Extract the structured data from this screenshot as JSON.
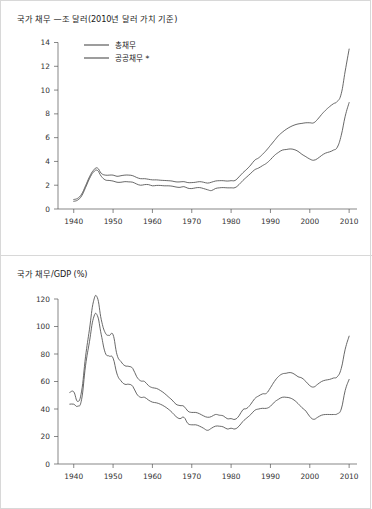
{
  "figure": {
    "background_color": "#ffffff",
    "border_color": "#d8d8d8",
    "line_color": "#4d4d4d",
    "axis_color": "#555555"
  },
  "panels": [
    {
      "id": "debt",
      "title": "국가 채무 —조 달러(2010년 달러 가치 기준)",
      "legend": {
        "position": "top-left",
        "entries": [
          {
            "label": "총채무"
          },
          {
            "label": "공공채무 *"
          }
        ]
      }
    },
    {
      "id": "ratio",
      "title": "국가 채무/GDP (%)",
      "legend": {
        "position": "none",
        "entries": []
      }
    }
  ],
  "chart_data": [
    {
      "type": "line",
      "title": "국가 채무 —조 달러(2010년 달러 가치 기준)",
      "xlabel": "",
      "ylabel": "조 달러 (2010년 달러 가치 기준)",
      "xlim": [
        1936,
        2012
      ],
      "ylim": [
        0,
        14.8
      ],
      "xticks": [
        1940,
        1950,
        1960,
        1970,
        1980,
        1990,
        2000,
        2010
      ],
      "yticks": [
        0,
        2,
        4,
        6,
        8,
        10,
        12,
        14
      ],
      "grid": false,
      "legend_position": "top-left",
      "x": [
        1940,
        1941,
        1942,
        1943,
        1944,
        1945,
        1946,
        1947,
        1948,
        1949,
        1950,
        1951,
        1952,
        1953,
        1954,
        1955,
        1956,
        1957,
        1958,
        1959,
        1960,
        1961,
        1962,
        1963,
        1964,
        1965,
        1966,
        1967,
        1968,
        1969,
        1970,
        1971,
        1972,
        1973,
        1974,
        1975,
        1976,
        1977,
        1978,
        1979,
        1980,
        1981,
        1982,
        1983,
        1984,
        1985,
        1986,
        1987,
        1988,
        1989,
        1990,
        1991,
        1992,
        1993,
        1994,
        1995,
        1996,
        1997,
        1998,
        1999,
        2000,
        2001,
        2002,
        2003,
        2004,
        2005,
        2006,
        2007,
        2008,
        2009,
        2010
      ],
      "series": [
        {
          "name": "총채무",
          "values": [
            0.8,
            0.9,
            1.25,
            1.95,
            2.7,
            3.25,
            3.45,
            3.0,
            2.85,
            2.85,
            2.85,
            2.75,
            2.8,
            2.85,
            2.85,
            2.8,
            2.65,
            2.55,
            2.55,
            2.5,
            2.45,
            2.45,
            2.42,
            2.4,
            2.38,
            2.35,
            2.28,
            2.28,
            2.3,
            2.22,
            2.22,
            2.25,
            2.3,
            2.25,
            2.18,
            2.25,
            2.35,
            2.38,
            2.38,
            2.35,
            2.38,
            2.4,
            2.7,
            3.05,
            3.35,
            3.7,
            4.1,
            4.3,
            4.6,
            4.95,
            5.35,
            5.75,
            6.15,
            6.45,
            6.7,
            6.9,
            7.05,
            7.15,
            7.2,
            7.25,
            7.25,
            7.25,
            7.55,
            7.95,
            8.3,
            8.6,
            8.85,
            9.05,
            9.7,
            11.6,
            13.45
          ]
        },
        {
          "name": "공공채무 *",
          "values": [
            0.65,
            0.75,
            1.1,
            1.8,
            2.55,
            3.1,
            3.25,
            2.75,
            2.45,
            2.4,
            2.35,
            2.25,
            2.25,
            2.3,
            2.28,
            2.25,
            2.1,
            2.0,
            2.05,
            2.05,
            1.95,
            1.98,
            1.98,
            1.95,
            1.95,
            1.92,
            1.85,
            1.82,
            1.88,
            1.75,
            1.72,
            1.78,
            1.8,
            1.72,
            1.62,
            1.55,
            1.72,
            1.78,
            1.8,
            1.78,
            1.78,
            1.8,
            2.05,
            2.4,
            2.7,
            3.0,
            3.3,
            3.45,
            3.65,
            3.85,
            4.15,
            4.5,
            4.75,
            4.95,
            5.0,
            5.05,
            5.0,
            4.85,
            4.6,
            4.4,
            4.2,
            4.1,
            4.25,
            4.5,
            4.7,
            4.8,
            4.95,
            5.2,
            6.2,
            7.8,
            8.95
          ]
        }
      ]
    },
    {
      "type": "line",
      "title": "국가 채무/GDP (%)",
      "xlabel": "",
      "ylabel": "%",
      "xlim": [
        1936,
        2012
      ],
      "ylim": [
        0,
        128
      ],
      "xticks": [
        1940,
        1950,
        1960,
        1970,
        1980,
        1990,
        2000,
        2010
      ],
      "yticks": [
        0,
        20,
        40,
        60,
        80,
        100,
        120
      ],
      "grid": false,
      "legend_position": "none",
      "x": [
        1939,
        1940,
        1941,
        1942,
        1943,
        1944,
        1945,
        1946,
        1947,
        1948,
        1949,
        1950,
        1951,
        1952,
        1953,
        1954,
        1955,
        1956,
        1957,
        1958,
        1959,
        1960,
        1961,
        1962,
        1963,
        1964,
        1965,
        1966,
        1967,
        1968,
        1969,
        1970,
        1971,
        1972,
        1973,
        1974,
        1975,
        1976,
        1977,
        1978,
        1979,
        1980,
        1981,
        1982,
        1983,
        1984,
        1985,
        1986,
        1987,
        1988,
        1989,
        1990,
        1991,
        1992,
        1993,
        1994,
        1995,
        1996,
        1997,
        1998,
        1999,
        2000,
        2001,
        2002,
        2003,
        2004,
        2005,
        2006,
        2007,
        2008,
        2009,
        2010
      ],
      "series": [
        {
          "name": "총채무",
          "values": [
            52.0,
            52.5,
            45.5,
            53.0,
            78.0,
            98.0,
            118.0,
            121.0,
            105.0,
            95.5,
            93.5,
            94.0,
            79.5,
            74.5,
            71.5,
            71.0,
            69.5,
            63.5,
            60.5,
            60.0,
            57.0,
            55.5,
            55.0,
            53.5,
            51.5,
            49.0,
            46.5,
            43.5,
            42.5,
            42.0,
            38.5,
            37.5,
            37.5,
            36.5,
            35.0,
            34.0,
            34.5,
            36.0,
            35.5,
            35.0,
            33.0,
            33.0,
            32.5,
            35.0,
            39.5,
            40.5,
            43.5,
            47.5,
            49.5,
            51.0,
            51.5,
            55.5,
            60.0,
            63.5,
            65.5,
            66.0,
            66.5,
            65.5,
            63.5,
            62.5,
            60.0,
            57.0,
            56.0,
            58.0,
            60.0,
            61.0,
            61.5,
            62.5,
            63.5,
            69.5,
            83.5,
            93.0
          ]
        },
        {
          "name": "공공채무 *",
          "values": [
            43.5,
            43.5,
            42.0,
            47.0,
            71.5,
            89.0,
            106.0,
            108.0,
            94.0,
            81.0,
            78.5,
            77.0,
            65.5,
            60.5,
            58.0,
            58.0,
            56.5,
            51.0,
            48.5,
            48.5,
            46.5,
            45.0,
            44.5,
            43.5,
            42.0,
            40.0,
            37.5,
            34.5,
            33.0,
            34.0,
            29.5,
            28.5,
            28.5,
            27.5,
            26.0,
            24.5,
            26.0,
            27.5,
            27.5,
            27.0,
            25.5,
            26.0,
            25.5,
            27.5,
            31.0,
            33.5,
            36.0,
            39.0,
            40.0,
            40.5,
            40.5,
            42.0,
            45.0,
            47.0,
            48.5,
            48.5,
            48.0,
            46.5,
            44.0,
            41.0,
            38.5,
            34.5,
            32.5,
            34.0,
            35.5,
            36.0,
            36.0,
            36.0,
            36.5,
            40.0,
            53.5,
            61.5
          ]
        }
      ]
    }
  ]
}
